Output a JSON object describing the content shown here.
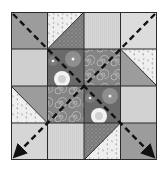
{
  "diagram": {
    "grid": {
      "rows": 4,
      "cols": 4
    },
    "colors": {
      "outline": "#2a2a2a",
      "medium_gray": "#9c9c9c",
      "light_gray": "#cfcfcf",
      "lighter_gray": "#dcdcdc",
      "butterfly_bg": "#efefef",
      "butterfly_motif": "#b4b4b4",
      "dotted_bg": "#7a7a7a",
      "flower_bg": "#6a6a6a",
      "flower_petal": "#8e8e8e",
      "flower_white": "#f2f2f2",
      "swirl_bg": "#848484",
      "swirl_line": "#c8c8c8",
      "arrow": "#111111"
    },
    "cells": [
      [
        "medium",
        "hst-butterfly-tl-dotted-br",
        "light",
        "lighter"
      ],
      [
        "light",
        "flower",
        "swirl",
        "hst-butterfly-tr-medium-bl"
      ],
      [
        "hst-medium-tr-butterfly-bl",
        "swirl",
        "flower",
        "light"
      ],
      [
        "light",
        "light",
        "hst-dotted-tl-butterfly-br",
        "medium"
      ]
    ],
    "arrows": [
      {
        "name": "diagonal-arrow-tl-to-br",
        "from": "top-left",
        "to": "bottom-right",
        "style": "dashed"
      },
      {
        "name": "diagonal-arrow-tr-to-bl",
        "from": "top-right",
        "to": "bottom-left",
        "style": "dashed"
      }
    ]
  }
}
